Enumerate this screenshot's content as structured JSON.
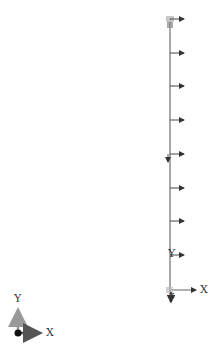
{
  "viewport": {
    "background": "#ffffff",
    "member": {
      "type": "vertical-beam",
      "x": 170,
      "y_top": 18,
      "y_bottom": 290,
      "color": "#9a9a9a"
    },
    "load_arrows": {
      "direction": "+X",
      "color": "#444444",
      "y_positions": [
        19,
        53,
        86,
        120,
        154,
        188,
        221,
        255
      ],
      "length": 14
    },
    "local_axes": {
      "origin": [
        170,
        290
      ],
      "x_label": "X",
      "y_label": "Y",
      "z_label": "Z"
    },
    "global_triad": {
      "origin": [
        18,
        333
      ],
      "x_label": "X",
      "y_label": "Y"
    }
  }
}
